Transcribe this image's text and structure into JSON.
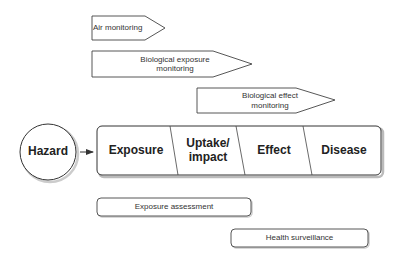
{
  "monitoring_arrows": [
    {
      "label": "Air monitoring"
    },
    {
      "label": "Biological exposure monitoring",
      "line1": "Biological exposure",
      "line2": "monitoring"
    },
    {
      "label": "Biological effect monitoring",
      "line1": "Biological effect",
      "line2": "monitoring"
    }
  ],
  "hazard": {
    "label": "Hazard"
  },
  "stages": [
    {
      "label": "Exposure"
    },
    {
      "label": "Uptake/ impact",
      "line1": "Uptake/",
      "line2": "impact"
    },
    {
      "label": "Effect"
    },
    {
      "label": "Disease"
    }
  ],
  "assessments": [
    {
      "label": "Exposure assessment"
    },
    {
      "label": "Health surveillance"
    }
  ],
  "colors": {
    "stroke": "#333333",
    "shadow": "#bbbbbb",
    "background": "#ffffff"
  }
}
